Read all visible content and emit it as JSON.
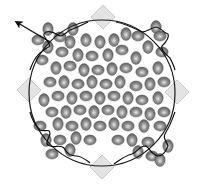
{
  "figure": {
    "width": 204,
    "height": 188,
    "background": "#ffffff",
    "circle": {
      "cx": 102,
      "cy": 93,
      "r": 73,
      "stroke": "#1a1a1a",
      "stroke_width": 1.2
    },
    "diamonds": [
      {
        "name": "diamond-top",
        "cx": 103,
        "cy": 17,
        "size": 12
      },
      {
        "name": "diamond-left",
        "cx": 29,
        "cy": 90,
        "size": 12
      },
      {
        "name": "diamond-right",
        "cx": 177,
        "cy": 92,
        "size": 12
      },
      {
        "name": "diamond-bottom",
        "cx": 102,
        "cy": 167,
        "size": 12
      }
    ],
    "diamond_fill": "#d9d9d9",
    "diamond_stroke": "#bdbdbd",
    "arrow": {
      "from": [
        50,
        42
      ],
      "to": [
        18,
        23
      ],
      "color": "#111111"
    },
    "particle_colors": {
      "edge": "#5a5a5a",
      "mid": "#8a8a8a",
      "highlight": "#e8e8e8"
    },
    "particles": [
      {
        "x": 48,
        "y": 29,
        "o": "v"
      },
      {
        "x": 60,
        "y": 37,
        "o": "h"
      },
      {
        "x": 73,
        "y": 29,
        "o": "v"
      },
      {
        "x": 38,
        "y": 40,
        "o": "h"
      },
      {
        "x": 48,
        "y": 47,
        "o": "v"
      },
      {
        "x": 62,
        "y": 52,
        "o": "h"
      },
      {
        "x": 70,
        "y": 42,
        "o": "v"
      },
      {
        "x": 86,
        "y": 40,
        "o": "v"
      },
      {
        "x": 100,
        "y": 42,
        "o": "v"
      },
      {
        "x": 114,
        "y": 40,
        "o": "v"
      },
      {
        "x": 126,
        "y": 34,
        "o": "v"
      },
      {
        "x": 138,
        "y": 36,
        "o": "h"
      },
      {
        "x": 156,
        "y": 27,
        "o": "v"
      },
      {
        "x": 160,
        "y": 36,
        "o": "h"
      },
      {
        "x": 148,
        "y": 47,
        "o": "v"
      },
      {
        "x": 162,
        "y": 52,
        "o": "h"
      },
      {
        "x": 42,
        "y": 60,
        "o": "h"
      },
      {
        "x": 78,
        "y": 55,
        "o": "v"
      },
      {
        "x": 92,
        "y": 56,
        "o": "h"
      },
      {
        "x": 108,
        "y": 55,
        "o": "v"
      },
      {
        "x": 122,
        "y": 50,
        "o": "h"
      },
      {
        "x": 136,
        "y": 58,
        "o": "v"
      },
      {
        "x": 56,
        "y": 68,
        "o": "v"
      },
      {
        "x": 70,
        "y": 66,
        "o": "h"
      },
      {
        "x": 84,
        "y": 70,
        "o": "v"
      },
      {
        "x": 98,
        "y": 70,
        "o": "h"
      },
      {
        "x": 112,
        "y": 69,
        "o": "v"
      },
      {
        "x": 126,
        "y": 68,
        "o": "h"
      },
      {
        "x": 142,
        "y": 72,
        "o": "h"
      },
      {
        "x": 158,
        "y": 68,
        "o": "v"
      },
      {
        "x": 50,
        "y": 82,
        "o": "h"
      },
      {
        "x": 64,
        "y": 82,
        "o": "v"
      },
      {
        "x": 78,
        "y": 84,
        "o": "h"
      },
      {
        "x": 92,
        "y": 82,
        "o": "v"
      },
      {
        "x": 106,
        "y": 84,
        "o": "h"
      },
      {
        "x": 120,
        "y": 82,
        "o": "v"
      },
      {
        "x": 136,
        "y": 86,
        "o": "h"
      },
      {
        "x": 150,
        "y": 84,
        "o": "v"
      },
      {
        "x": 164,
        "y": 82,
        "o": "h"
      },
      {
        "x": 44,
        "y": 100,
        "o": "v"
      },
      {
        "x": 58,
        "y": 96,
        "o": "h"
      },
      {
        "x": 72,
        "y": 98,
        "o": "v"
      },
      {
        "x": 86,
        "y": 96,
        "o": "h"
      },
      {
        "x": 100,
        "y": 98,
        "o": "v"
      },
      {
        "x": 114,
        "y": 96,
        "o": "h"
      },
      {
        "x": 128,
        "y": 98,
        "o": "v"
      },
      {
        "x": 142,
        "y": 100,
        "o": "h"
      },
      {
        "x": 158,
        "y": 98,
        "o": "v"
      },
      {
        "x": 52,
        "y": 112,
        "o": "h"
      },
      {
        "x": 66,
        "y": 112,
        "o": "v"
      },
      {
        "x": 80,
        "y": 110,
        "o": "h"
      },
      {
        "x": 94,
        "y": 112,
        "o": "v"
      },
      {
        "x": 108,
        "y": 110,
        "o": "h"
      },
      {
        "x": 122,
        "y": 112,
        "o": "v"
      },
      {
        "x": 136,
        "y": 112,
        "o": "h"
      },
      {
        "x": 150,
        "y": 114,
        "o": "v"
      },
      {
        "x": 164,
        "y": 112,
        "o": "h"
      },
      {
        "x": 40,
        "y": 126,
        "o": "h"
      },
      {
        "x": 58,
        "y": 124,
        "o": "v"
      },
      {
        "x": 72,
        "y": 126,
        "o": "h"
      },
      {
        "x": 86,
        "y": 124,
        "o": "v"
      },
      {
        "x": 100,
        "y": 126,
        "o": "h"
      },
      {
        "x": 114,
        "y": 124,
        "o": "v"
      },
      {
        "x": 128,
        "y": 126,
        "o": "h"
      },
      {
        "x": 144,
        "y": 126,
        "o": "v"
      },
      {
        "x": 160,
        "y": 126,
        "o": "h"
      },
      {
        "x": 46,
        "y": 140,
        "o": "v"
      },
      {
        "x": 60,
        "y": 140,
        "o": "h"
      },
      {
        "x": 76,
        "y": 138,
        "o": "v"
      },
      {
        "x": 90,
        "y": 140,
        "o": "h"
      },
      {
        "x": 118,
        "y": 140,
        "o": "h"
      },
      {
        "x": 132,
        "y": 140,
        "o": "v"
      },
      {
        "x": 148,
        "y": 142,
        "o": "h"
      },
      {
        "x": 168,
        "y": 146,
        "o": "v"
      },
      {
        "x": 52,
        "y": 154,
        "o": "h"
      },
      {
        "x": 70,
        "y": 150,
        "o": "v"
      },
      {
        "x": 138,
        "y": 152,
        "o": "v"
      },
      {
        "x": 152,
        "y": 156,
        "o": "h"
      },
      {
        "x": 160,
        "y": 160,
        "o": "v"
      }
    ]
  }
}
